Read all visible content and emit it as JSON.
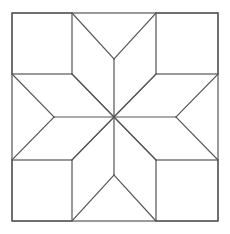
{
  "diagram": {
    "title": "",
    "line_color": "#555555",
    "background": "#ffffff",
    "grid": "3x3 block with diamond star",
    "pieces": {
      "corner_squares": 4,
      "star_diamonds": 8,
      "edge_triangles": 4
    }
  }
}
